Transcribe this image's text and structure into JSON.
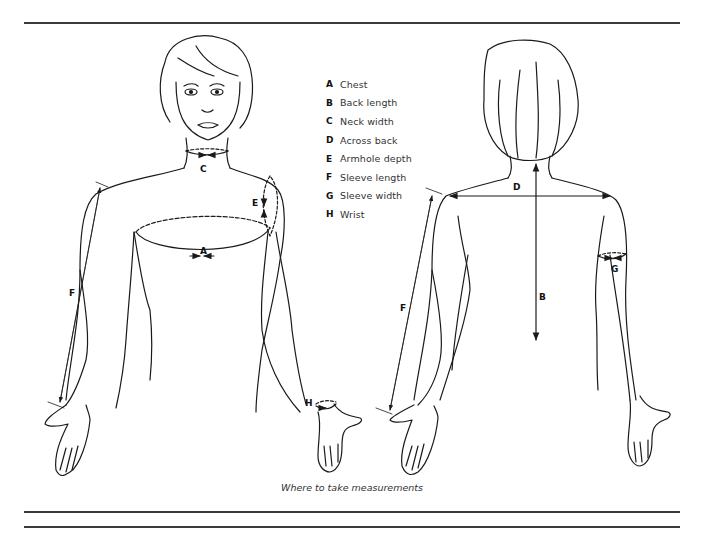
{
  "legend": {
    "items": [
      {
        "key": "A",
        "label": "Chest"
      },
      {
        "key": "B",
        "label": "Back length"
      },
      {
        "key": "C",
        "label": "Neck width"
      },
      {
        "key": "D",
        "label": "Across back"
      },
      {
        "key": "E",
        "label": "Armhole depth"
      },
      {
        "key": "F",
        "label": "Sleeve length"
      },
      {
        "key": "G",
        "label": "Sleeve width"
      },
      {
        "key": "H",
        "label": "Wrist"
      }
    ]
  },
  "front_figure": {
    "labels": {
      "A": "A",
      "C": "C",
      "E": "E",
      "F": "F",
      "H": "H"
    }
  },
  "back_figure": {
    "labels": {
      "B": "B",
      "D": "D",
      "F": "F",
      "G": "G"
    }
  },
  "caption": "Where to take measurements",
  "colors": {
    "line": "#1a1a1a",
    "rule": "#3a3a3a",
    "background": "#ffffff"
  }
}
